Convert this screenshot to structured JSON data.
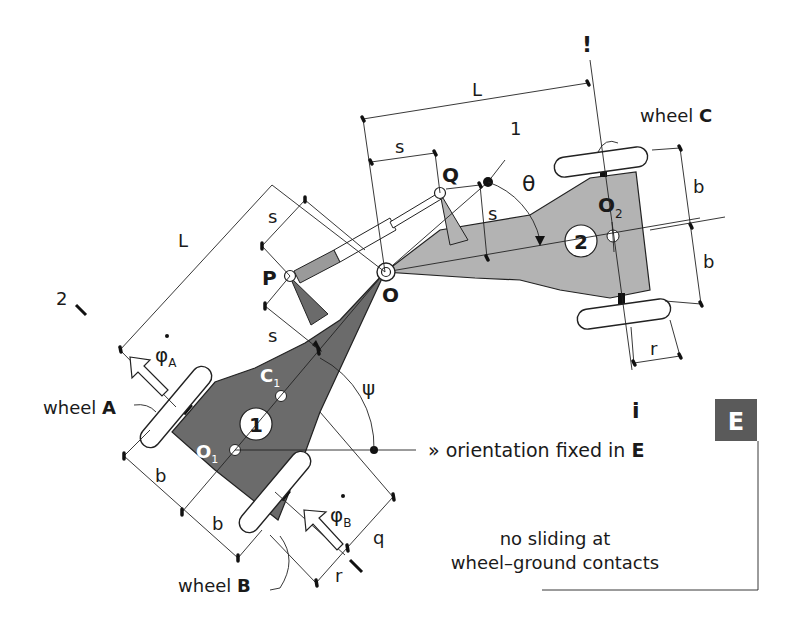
{
  "diagram": {
    "colors": {
      "body1_fill": "#6b6b6b",
      "body2_fill": "#b3b3b3",
      "frame_box_fill": "#5a5a5a",
      "cylinder_fill": "#9a9a9a",
      "line": "#222222"
    },
    "labels": {
      "wheel_A": {
        "prefix": "wheel ",
        "name": "A"
      },
      "wheel_B": {
        "prefix": "wheel ",
        "name": "B"
      },
      "wheel_C": {
        "prefix": "wheel ",
        "name": "C"
      },
      "phi_A": {
        "sym": "φ",
        "sub": "A"
      },
      "phi_B": {
        "sym": "φ",
        "sub": "B"
      },
      "point_P": "P",
      "point_Q": "Q",
      "point_O": "O",
      "point_O1": {
        "sym": "O",
        "sub": "1"
      },
      "point_O2": {
        "sym": "O",
        "sub": "2"
      },
      "point_C1": {
        "sym": "C",
        "sub": "1"
      },
      "body_1": "1",
      "body_2": "2",
      "axis_1": "1",
      "axis_2": "2",
      "angle_theta": "θ",
      "angle_psi": "ψ",
      "dim_L_top": "L",
      "dim_L_left": "L",
      "dim_s_top": "s",
      "dim_s_upper_left": "s",
      "dim_s_lower_left": "s",
      "dim_s_right": "s",
      "dim_b_c_upper": "b",
      "dim_b_c_lower": "b",
      "dim_b_ab_upper": "b",
      "dim_b_ab_lower": "b",
      "dim_r_c": "r",
      "dim_r_b": "r",
      "dim_q": "q",
      "orientation_text": {
        "prefix": "» orientation fixed in ",
        "frame": "E"
      },
      "frame_label": "E",
      "note_line1": "no sliding at",
      "note_line2": "wheel–ground contacts",
      "axis_mark_top": "!",
      "axis_mark_bottom": "i"
    }
  }
}
